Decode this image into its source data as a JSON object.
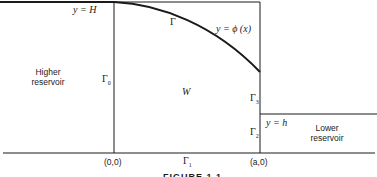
{
  "labels": {
    "top_line": "y = H",
    "curve_gamma": "Γ",
    "curve_eq": "y = ϕ (x)",
    "higher_reservoir_line1": "Higher",
    "higher_reservoir_line2": "reservoir",
    "gamma0": "Γ",
    "gamma0_sub": "0",
    "region": "W",
    "gamma3": "Γ",
    "gamma3_sub": "3",
    "gamma2": "Γ",
    "gamma2_sub": "2",
    "gamma1": "Γ",
    "gamma1_sub": "1",
    "lower_line": "y = h",
    "lower_reservoir_line1": "Lower",
    "lower_reservoir_line2": "reservoir",
    "origin": "(0,0)",
    "point_a": "(a,0)"
  },
  "caption": "FIGURE 1.1",
  "colors": {
    "line": "#1a1a1a",
    "background": "#ffffff"
  }
}
